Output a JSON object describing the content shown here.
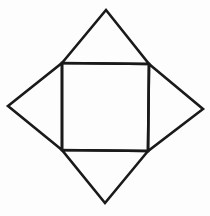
{
  "diagram": {
    "stroke_color": "#1a1a1a",
    "background_color": "#fdfdfd",
    "stroke_width": 2.6,
    "square": {
      "points": [
        [
          62,
          63
        ],
        [
          149,
          64
        ],
        [
          148,
          151
        ],
        [
          62,
          150
        ]
      ]
    },
    "triangles": [
      {
        "name": "top",
        "points": [
          [
            62,
            63
          ],
          [
            106,
            10
          ],
          [
            149,
            64
          ]
        ]
      },
      {
        "name": "right",
        "points": [
          [
            149,
            64
          ],
          [
            203,
            109
          ],
          [
            148,
            151
          ]
        ]
      },
      {
        "name": "bottom",
        "points": [
          [
            148,
            151
          ],
          [
            105,
            203
          ],
          [
            62,
            150
          ]
        ]
      },
      {
        "name": "left",
        "points": [
          [
            62,
            150
          ],
          [
            8,
            106
          ],
          [
            62,
            63
          ]
        ]
      }
    ]
  }
}
